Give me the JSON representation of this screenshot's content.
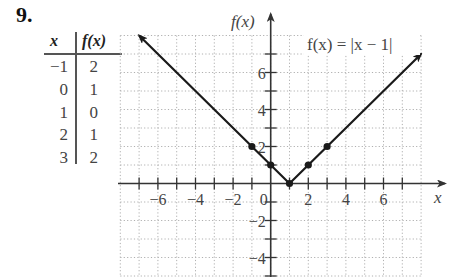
{
  "problem": {
    "number": "9."
  },
  "table": {
    "headers": {
      "x": "x",
      "fx": "f(x)"
    },
    "rows": [
      {
        "x": "−1",
        "fx": "2"
      },
      {
        "x": "0",
        "fx": "1"
      },
      {
        "x": "1",
        "fx": "0"
      },
      {
        "x": "2",
        "fx": "1"
      },
      {
        "x": "3",
        "fx": "2"
      }
    ]
  },
  "chart_data": {
    "type": "line",
    "title": "f(x) = |x − 1|",
    "function": "f(x) = |x - 1|",
    "xlabel": "x",
    "ylabel": "f(x)",
    "xlim": [
      -8,
      8
    ],
    "ylim": [
      -5,
      8
    ],
    "grid": true,
    "x_ticks": [
      -6,
      -4,
      -2,
      2,
      4,
      6
    ],
    "y_ticks": [
      -4,
      -2,
      2,
      4,
      6
    ],
    "origin_label": "0",
    "series": [
      {
        "name": "f(x) = |x − 1|",
        "x": [
          -7,
          1,
          8
        ],
        "y": [
          8,
          0,
          7
        ],
        "arrows": "both ends"
      }
    ],
    "points": [
      {
        "x": -1,
        "y": 2
      },
      {
        "x": 0,
        "y": 1
      },
      {
        "x": 1,
        "y": 0
      },
      {
        "x": 2,
        "y": 1
      },
      {
        "x": 3,
        "y": 2
      }
    ],
    "colors": {
      "line": "#1a1a1a",
      "grid": "#b0b0b0",
      "axis": "#333333",
      "text": "#444444"
    }
  }
}
